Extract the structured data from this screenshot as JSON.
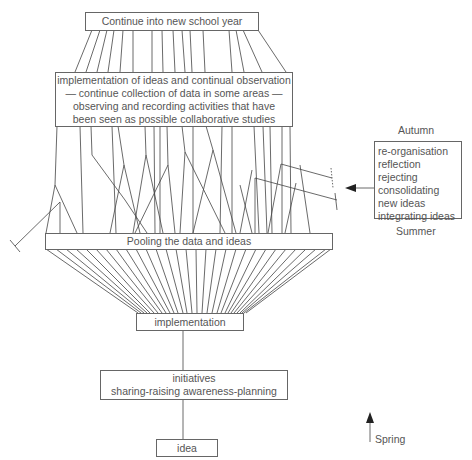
{
  "diagram": {
    "boxes": {
      "top": "Continue into new school year",
      "observation": [
        "implementation of ideas and continual observation",
        "— continue collection of data in some areas —",
        "observing and recording activities that have",
        "been seen as possible collaborative studies"
      ],
      "pooling": "Pooling the data and ideas",
      "implementation": "implementation",
      "initiatives": [
        "initiatives",
        "sharing-raising awareness-planning"
      ],
      "idea": "idea"
    },
    "side_panel": {
      "top_label": "Autumn",
      "items": [
        "re-organisation",
        "reflection",
        "rejecting",
        "consolidating",
        "new ideas",
        "integrating ideas"
      ],
      "bottom_label": "Summer",
      "arrow": "arrow-left"
    },
    "season_arrow": {
      "label": "Spring",
      "arrow": "arrow-up"
    },
    "colors": {
      "line": "#444444",
      "box_border": "#666666",
      "text": "#555555",
      "background": "#ffffff"
    }
  }
}
